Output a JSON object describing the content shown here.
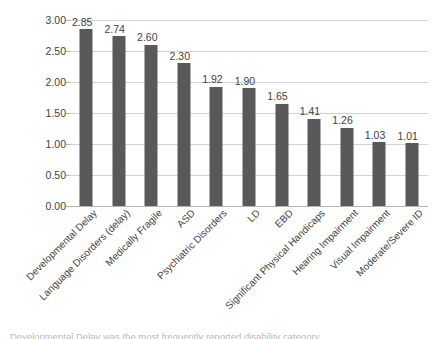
{
  "chart_data": {
    "type": "bar",
    "title": "",
    "subtitle": "",
    "xlabel": "",
    "ylabel": "",
    "ylim": [
      0,
      3.0
    ],
    "ytick_step": 0.5,
    "ytick_labels": [
      "0.00",
      "0.50",
      "1.00",
      "1.50",
      "2.00",
      "2.50",
      "3.00"
    ],
    "ytick_values": [
      0,
      0.5,
      1.0,
      1.5,
      2.0,
      2.5,
      3.0
    ],
    "grid": true,
    "grid_axis": "y",
    "legend": false,
    "legend_position": "none",
    "bar_color": "#595959",
    "grid_color": "#d2d2d2",
    "axis_color": "#b4b4b4",
    "label_rotation_degrees": -45,
    "categories": [
      "Developmental Delay",
      "Language Disorders (delay)",
      "Medically Fragile",
      "ASD",
      "Psychiatric Disorders",
      "LD",
      "EBD",
      "Significant Physical Handicaps",
      "Hearing Impairment",
      "Visual Impairment",
      "Moderate/Severe ID"
    ],
    "values": [
      2.85,
      2.74,
      2.6,
      2.3,
      1.92,
      1.9,
      1.65,
      1.41,
      1.26,
      1.03,
      1.01
    ],
    "data_labels": [
      "2.85",
      "2.74",
      "2.60",
      "2.30",
      "1.92",
      "1.90",
      "1.65",
      "1.41",
      "1.26",
      "1.03",
      "1.01"
    ]
  },
  "caption": {
    "text": "Developmental Delay was the most frequently reported disability category"
  }
}
